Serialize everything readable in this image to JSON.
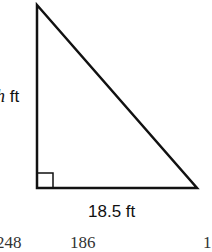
{
  "figure": {
    "type": "right-triangle",
    "right_angle_vertex": "bottom-left",
    "height_label": {
      "variable": "h",
      "unit": "ft"
    },
    "base_label": "18.5 ft",
    "stroke_color": "#111111",
    "background": "#ffffff"
  },
  "cutoff_answer_choices": [
    "248",
    "186",
    "1"
  ]
}
